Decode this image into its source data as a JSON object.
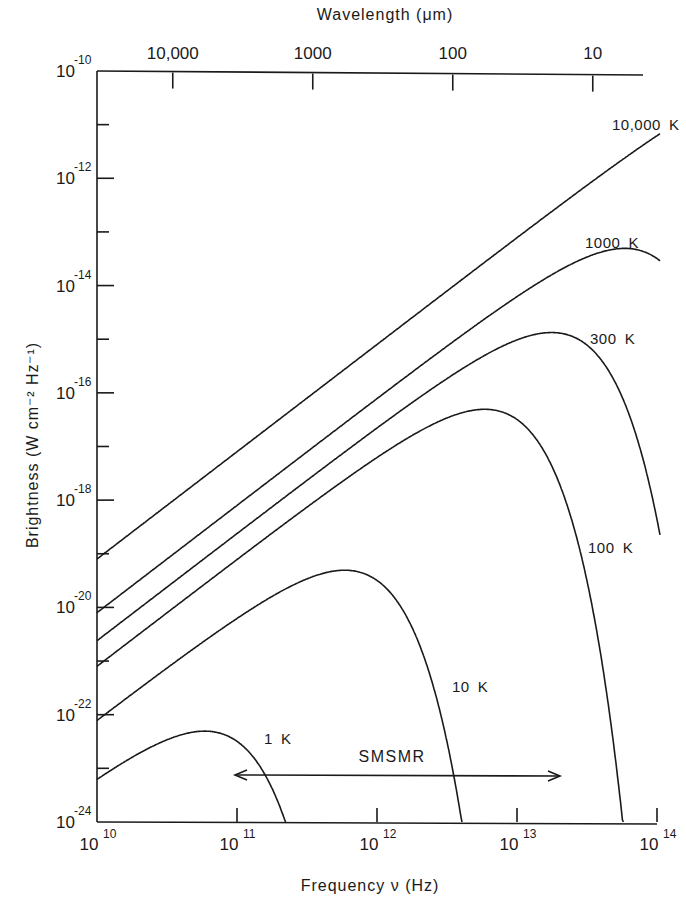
{
  "chart_data": {
    "type": "line",
    "title": "",
    "xlabel": "Frequency ν (Hz)",
    "ylabel": "Brightness (W cm⁻² Hz⁻¹)",
    "top_xlabel": "Wavelength (μm)",
    "x_scale": "log",
    "y_scale": "log",
    "xlim": [
      10000000000.0,
      100000000000000.0
    ],
    "ylim": [
      1e-24,
      1e-10
    ],
    "grid": false,
    "x_ticks": [
      {
        "value": 10000000000.0,
        "base": "10",
        "exp": "10"
      },
      {
        "value": 100000000000.0,
        "base": "10",
        "exp": "11"
      },
      {
        "value": 1000000000000.0,
        "base": "10",
        "exp": "12"
      },
      {
        "value": 10000000000000.0,
        "base": "10",
        "exp": "13"
      },
      {
        "value": 100000000000000.0,
        "base": "10",
        "exp": "14"
      }
    ],
    "y_ticks_major": [
      {
        "value": 1e-10,
        "base": "10",
        "exp": "-10"
      },
      {
        "value": 1e-12,
        "base": "10",
        "exp": "-12"
      },
      {
        "value": 1e-14,
        "base": "10",
        "exp": "-14"
      },
      {
        "value": 1e-16,
        "base": "10",
        "exp": "-16"
      },
      {
        "value": 1e-18,
        "base": "10",
        "exp": "-18"
      },
      {
        "value": 1e-20,
        "base": "10",
        "exp": "-20"
      },
      {
        "value": 1e-22,
        "base": "10",
        "exp": "-22"
      },
      {
        "value": 1e-24,
        "base": "10",
        "exp": "-24"
      }
    ],
    "y_ticks_minor": [
      1e-11,
      1e-13,
      1e-15,
      1e-17,
      1e-19,
      1e-21,
      1e-23
    ],
    "top_ticks": [
      {
        "wavelength_um": 10000,
        "label": "10,000"
      },
      {
        "wavelength_um": 1000,
        "label": "1000"
      },
      {
        "wavelength_um": 100,
        "label": "100"
      },
      {
        "wavelength_um": 10,
        "label": "10"
      }
    ],
    "series": [
      {
        "name": "10,000 K",
        "temperature_K": 10000,
        "start_value": 8.1e-20,
        "peak": null
      },
      {
        "name": "1000 K",
        "temperature_K": 1000,
        "start_value": 8.1e-21,
        "peak": {
          "x": 59000000000000.0,
          "y": 2.5e-14
        }
      },
      {
        "name": "300 K",
        "temperature_K": 300,
        "start_value": 2.4e-21,
        "peak": {
          "x": 18000000000000.0,
          "y": 8.5e-16
        }
      },
      {
        "name": "100 K",
        "temperature_K": 100,
        "start_value": 8.1e-22,
        "peak": {
          "x": 5900000000000.0,
          "y": 3.2e-17
        }
      },
      {
        "name": "10 K",
        "temperature_K": 10,
        "start_value": 8.1e-23,
        "peak": {
          "x": 590000000000.0,
          "y": 6e-20
        }
      },
      {
        "name": "1 K",
        "temperature_K": 1,
        "start_value": 8.1e-24,
        "peak": {
          "x": 59000000000.0,
          "y": 1e-22
        }
      }
    ],
    "annotations": [
      {
        "text": "SMSMR",
        "type": "double-arrow",
        "x_range": [
          100000000000.0,
          20000000000000.0
        ],
        "y": 1.5e-23
      }
    ]
  }
}
